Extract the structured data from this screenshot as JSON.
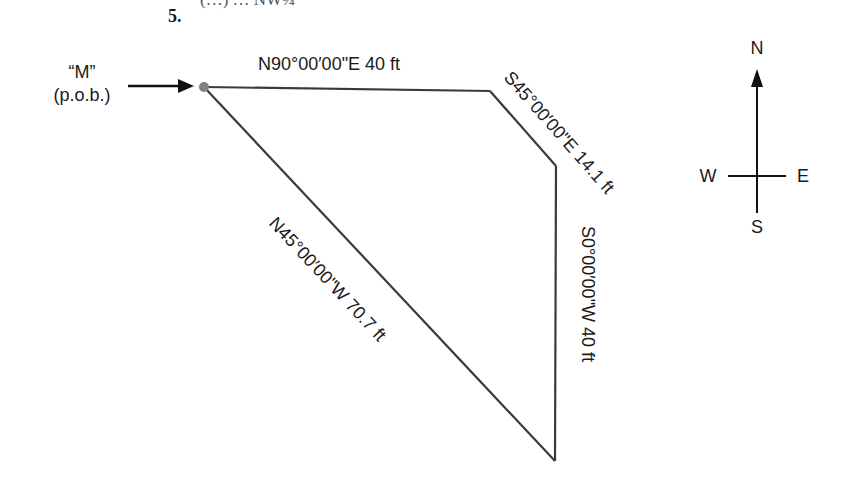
{
  "problem": {
    "number": "5.",
    "partial_header_text": "(…) … NW¼"
  },
  "pob": {
    "label_line1": "“M”",
    "label_line2": "(p.o.b.)"
  },
  "courses": [
    {
      "bearing_distance": "N90°00′00\"E 40 ft"
    },
    {
      "bearing_distance": "S45°00′00\"E 14.1 ft"
    },
    {
      "bearing_distance": "S0°00′00\"W 40 ft"
    },
    {
      "bearing_distance": "N45°00′00\"W 70.7 ft"
    }
  ],
  "compass": {
    "north": "N",
    "south": "S",
    "east": "E",
    "west": "W"
  },
  "colors": {
    "line": "#3a3a3a",
    "pob_dot": "#808080",
    "text": "#1a1a1a"
  }
}
